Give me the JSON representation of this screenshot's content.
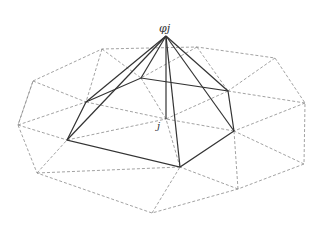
{
  "diagram": {
    "type": "finite-element-basis-function",
    "labels": {
      "apex": "φj",
      "node": "j"
    },
    "colors": {
      "solid_edges": "#333333",
      "dashed_mesh": "#8a8a8a",
      "background": "#ffffff"
    },
    "points": {
      "apex": [
        166,
        36
      ],
      "node_j": [
        166,
        119
      ],
      "hexagon": [
        [
          86,
          102
        ],
        [
          141,
          78
        ],
        [
          228,
          91
        ],
        [
          234,
          131
        ],
        [
          180,
          167
        ],
        [
          67,
          140
        ]
      ],
      "outer": [
        [
          33,
          81
        ],
        [
          102,
          49
        ],
        [
          197,
          47
        ],
        [
          275,
          58
        ],
        [
          305,
          103
        ],
        [
          304,
          164
        ],
        [
          238,
          189
        ],
        [
          152,
          213
        ],
        [
          37,
          173
        ],
        [
          18,
          125
        ]
      ]
    }
  }
}
